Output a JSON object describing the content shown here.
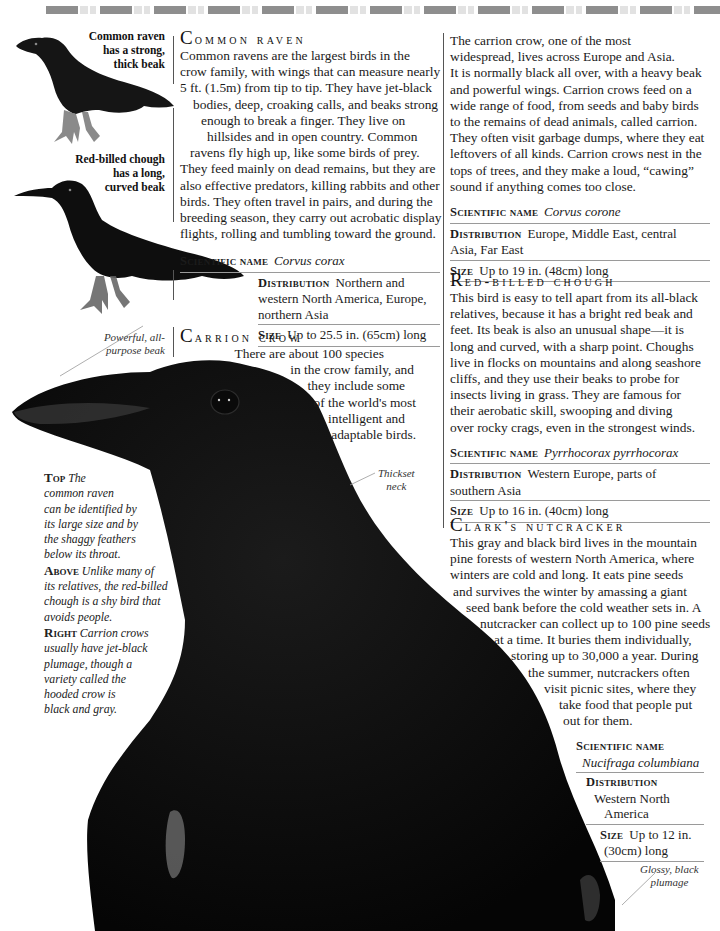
{
  "page": {
    "accent_colors": {
      "text": "#1a1a1a",
      "rule": "#9a9a9a",
      "bird": "#0b0b0b"
    }
  },
  "images": {
    "raven": {
      "icon": "common-raven-illustration"
    },
    "chough": {
      "icon": "red-billed-chough-illustration"
    },
    "crow": {
      "icon": "carrion-crow-photo"
    }
  },
  "captions": {
    "raven": [
      "Common raven",
      "has a strong,",
      "thick beak"
    ],
    "chough": [
      "Red-billed chough",
      "has a long,",
      "curved beak"
    ],
    "beak": [
      "Powerful, all-",
      "purpose beak"
    ],
    "neck": [
      "Thickset",
      "neck"
    ],
    "plumage": [
      "Glossy, black",
      "plumage"
    ]
  },
  "side_caption": {
    "top_label": "Top",
    "top_lines": [
      "The",
      "common raven",
      "can be identified by",
      "its large size and by",
      "the shaggy feathers",
      "below its throat."
    ],
    "above_label": "Above",
    "above_lines": [
      "Unlike many of",
      "its relatives, the red-billed",
      "chough is a shy bird that",
      "avoids people."
    ],
    "right_label": "Right",
    "right_lines": [
      "Carrion crows",
      "usually have jet-black",
      "plumage, though a",
      "variety called the",
      "hooded crow is",
      "black and gray."
    ]
  },
  "sections": {
    "common_raven": {
      "title_initial": "C",
      "title_rest": "ommon raven",
      "body_lines": [
        "Common ravens are the largest birds in the",
        "crow family, with wings that can measure nearly",
        "5 ft. (1.5m) from tip to tip. They have jet-black",
        "bodies, deep, croaking calls, and beaks strong",
        "enough to break a finger. They live on",
        "hillsides and in open country. Common",
        "ravens fly high up, like some birds of prey.",
        "They feed mainly on dead remains, but they are",
        "also effective predators, killing rabbits and other",
        "birds. They often travel in pairs, and during the",
        "breeding season, they carry out acrobatic display",
        "flights, rolling and tumbling toward the ground."
      ],
      "scientific_label": "Scientific name",
      "scientific": "Corvus corax",
      "distribution_label": "Distribution",
      "distribution_lines": [
        "Northern and",
        "western North America, Europe,",
        "northern Asia"
      ],
      "size_label": "Size",
      "size": "Up to 25.5 in. (65cm) long"
    },
    "carrion_crow": {
      "title_initial": "C",
      "title_rest": "arrion crow",
      "intro_lines": [
        "There are about 100 species",
        "in the crow family, and",
        "they include some",
        "of the world's most",
        "intelligent and",
        "adaptable birds."
      ],
      "body_lines": [
        "The carrion crow, one of the most",
        "widespread, lives across Europe and Asia.",
        "It is normally black all over, with a heavy beak",
        "and powerful wings. Carrion crows feed on a",
        "wide range of food, from seeds and baby birds",
        "to the remains of dead animals, called carrion.",
        "They often visit garbage dumps, where they eat",
        "leftovers of all kinds. Carrion crows nest in the",
        "tops of trees, and they make a loud, “cawing”",
        "sound if anything comes too close."
      ],
      "scientific_label": "Scientific name",
      "scientific": "Corvus corone",
      "distribution_label": "Distribution",
      "distribution_lines": [
        "Europe, Middle East, central",
        "Asia, Far East"
      ],
      "size_label": "Size",
      "size": "Up to 19 in. (48cm) long"
    },
    "red_billed_chough": {
      "title_initial": "R",
      "title_rest": "ed-billed chough",
      "body_lines": [
        "This bird is easy to tell apart from its all-black",
        "relatives, because it has a bright red beak and",
        "feet. Its beak is also an unusual shape—it is",
        "long and curved, with a sharp point. Choughs",
        "live in flocks on mountains and along seashore",
        "cliffs, and they use their beaks to probe for",
        "insects living in grass. They are famous for",
        "their aerobatic skill, swooping and diving",
        "over rocky crags, even in the strongest winds."
      ],
      "scientific_label": "Scientific name",
      "scientific": "Pyrrhocorax pyrrhocorax",
      "distribution_label": "Distribution",
      "distribution_lines": [
        "Western Europe, parts of",
        "southern Asia"
      ],
      "size_label": "Size",
      "size": "Up to 16 in. (40cm) long"
    },
    "clarks_nutcracker": {
      "title_initial": "C",
      "title_rest": "lark's nutcracker",
      "body_lines": [
        "This gray and black bird lives in the mountain",
        "pine forests of western North America, where",
        "winters are cold and long. It eats pine seeds",
        "and survives the winter by amassing a giant",
        "seed bank before the cold weather sets in. A",
        "nutcracker can collect up to 100 pine seeds",
        "at a time. It buries them individually,",
        "storing up to 30,000 a year. During",
        "the summer, nutcrackers often",
        "visit picnic sites, where they",
        "take food that people put",
        "out for them."
      ],
      "scientific_label": "Scientific name",
      "scientific": "Nucifraga columbiana",
      "distribution_label": "Distribution",
      "distribution_lines": [
        "Western North",
        "America"
      ],
      "size_label": "Size",
      "size_lines": [
        "Up to 12 in.",
        "(30cm) long"
      ]
    }
  }
}
